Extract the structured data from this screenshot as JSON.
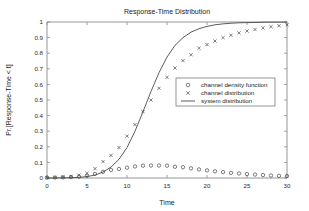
{
  "chart_data": {
    "type": "scatter",
    "title": "Response-Time Distribution",
    "xlabel": "Time",
    "ylabel": "Pr.[Response-Time < t]",
    "xlim": [
      0,
      30
    ],
    "ylim": [
      0,
      1
    ],
    "xticks": [
      0,
      5,
      10,
      15,
      20,
      25,
      30
    ],
    "xticklabels": [
      "0",
      "5",
      "10",
      "15",
      "20",
      "25",
      "30"
    ],
    "yticks": [
      0,
      0.1,
      0.2,
      0.3,
      0.4,
      0.5,
      0.6,
      0.7,
      0.8,
      0.9,
      1
    ],
    "yticklabels": [
      "0",
      "0.1",
      "0.2",
      "0.3",
      "0.4",
      "0.5",
      "0.6",
      "0.7",
      "0.8",
      "0.9",
      "1"
    ],
    "grid": false,
    "legend_position": "center-right",
    "series": [
      {
        "name": "channel density function",
        "marker": "circle",
        "style": "markers",
        "x": [
          0,
          1,
          2,
          3,
          4,
          5,
          6,
          7,
          8,
          9,
          10,
          11,
          12,
          13,
          14,
          15,
          16,
          17,
          18,
          19,
          20,
          21,
          22,
          23,
          24,
          25,
          26,
          27,
          28,
          29,
          30
        ],
        "y": [
          0.002,
          0.003,
          0.004,
          0.006,
          0.009,
          0.015,
          0.026,
          0.04,
          0.052,
          0.058,
          0.066,
          0.074,
          0.079,
          0.08,
          0.08,
          0.079,
          0.072,
          0.069,
          0.062,
          0.055,
          0.049,
          0.043,
          0.038,
          0.033,
          0.029,
          0.025,
          0.022,
          0.019,
          0.016,
          0.014,
          0.012
        ]
      },
      {
        "name": "channel distribution",
        "marker": "cross",
        "style": "markers",
        "x": [
          0,
          1,
          2,
          3,
          4,
          5,
          6,
          7,
          8,
          9,
          10,
          11,
          12,
          13,
          14,
          15,
          16,
          17,
          18,
          19,
          20,
          21,
          22,
          23,
          24,
          25,
          26,
          27,
          28,
          29,
          30
        ],
        "y": [
          0.002,
          0.004,
          0.007,
          0.011,
          0.018,
          0.03,
          0.06,
          0.105,
          0.145,
          0.195,
          0.268,
          0.342,
          0.425,
          0.5,
          0.575,
          0.645,
          0.705,
          0.752,
          0.79,
          0.832,
          0.855,
          0.878,
          0.9,
          0.915,
          0.93,
          0.942,
          0.952,
          0.962,
          0.97,
          0.976,
          0.982
        ]
      },
      {
        "name": "system distribution",
        "marker": "none",
        "style": "line",
        "x": [
          0,
          1,
          2,
          3,
          4,
          5,
          6,
          7,
          8,
          9,
          10,
          11,
          12,
          13,
          14,
          15,
          16,
          17,
          18,
          19,
          20,
          21,
          22,
          23,
          24,
          25,
          26,
          27,
          28,
          29,
          30
        ],
        "y": [
          0.0,
          0.0,
          0.001,
          0.002,
          0.004,
          0.009,
          0.019,
          0.038,
          0.07,
          0.12,
          0.195,
          0.3,
          0.425,
          0.555,
          0.675,
          0.775,
          0.85,
          0.9,
          0.935,
          0.957,
          0.972,
          0.982,
          0.988,
          0.992,
          0.995,
          0.996,
          0.997,
          0.998,
          0.999,
          0.999,
          1.0
        ]
      }
    ]
  },
  "legend": {
    "entries": [
      {
        "label": "channel density function",
        "marker": "circle"
      },
      {
        "label": "channel distribution",
        "marker": "cross"
      },
      {
        "label": "system distribution",
        "marker": "line"
      }
    ]
  }
}
